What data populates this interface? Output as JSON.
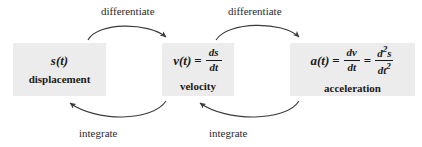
{
  "diagram": {
    "background_color": "#ffffff",
    "box_fill_color": "#ececec",
    "ink_color": "#1a1a1a",
    "boxes": [
      {
        "id": "displacement",
        "symbol": "s(t)",
        "label": "displacement",
        "formula_plain": "s(t)"
      },
      {
        "id": "velocity",
        "symbol": "v(t)",
        "equals": "=",
        "label": "velocity",
        "formula_plain": "v(t) = ds/dt",
        "fraction_1": {
          "numerator": "ds",
          "denominator": "dt"
        }
      },
      {
        "id": "acceleration",
        "symbol": "a(t)",
        "equals": "=",
        "equals_2": "=",
        "label": "acceleration",
        "formula_plain": "a(t) = dv/dt = d²s/dt²",
        "fraction_1": {
          "numerator": "dv",
          "denominator": "dt"
        },
        "fraction_2": {
          "numerator_base": "d",
          "numerator_sup": "2",
          "numerator_var": "s",
          "denominator_base": "dt",
          "denominator_sup": "2"
        }
      }
    ],
    "arrows": [
      {
        "id": "differentiate-1",
        "label": "differentiate",
        "from": "displacement",
        "to": "velocity",
        "direction": "left-to-right",
        "position": "top"
      },
      {
        "id": "differentiate-2",
        "label": "differentiate",
        "from": "velocity",
        "to": "acceleration",
        "direction": "left-to-right",
        "position": "top"
      },
      {
        "id": "integrate-1",
        "label": "integrate",
        "from": "velocity",
        "to": "displacement",
        "direction": "right-to-left",
        "position": "bottom"
      },
      {
        "id": "integrate-2",
        "label": "integrate",
        "from": "acceleration",
        "to": "velocity",
        "direction": "right-to-left",
        "position": "bottom"
      }
    ]
  }
}
